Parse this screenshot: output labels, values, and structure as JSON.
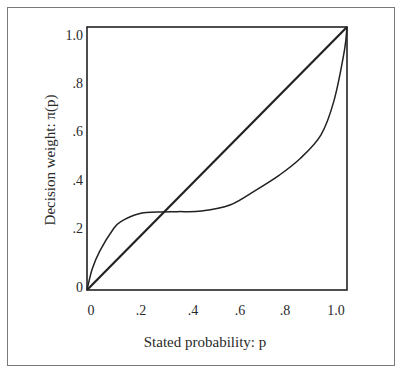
{
  "chart_data": {
    "type": "line",
    "title": "",
    "xlabel": "Stated probability: p",
    "ylabel": "Decision weight: π(p)",
    "xlim": [
      0,
      1
    ],
    "ylim": [
      0,
      1
    ],
    "grid": false,
    "legend": null,
    "x_ticks": [
      "0",
      ".2",
      ".4",
      ".6",
      ".8",
      "1.0"
    ],
    "y_ticks": [
      "0",
      ".2",
      ".4",
      ".6",
      ".8",
      "1.0"
    ],
    "series": [
      {
        "name": "Identity line (π(p) = p)",
        "x": [
          0,
          1
        ],
        "y": [
          0,
          1
        ]
      },
      {
        "name": "Decision weight curve π(p)",
        "x": [
          0,
          0.02,
          0.05,
          0.1,
          0.13,
          0.2,
          0.29,
          0.35,
          0.44,
          0.55,
          0.65,
          0.74,
          0.82,
          0.9,
          0.95,
          0.99,
          1.0
        ],
        "y": [
          0,
          0.08,
          0.15,
          0.23,
          0.26,
          0.29,
          0.297,
          0.298,
          0.3,
          0.323,
          0.38,
          0.437,
          0.5,
          0.59,
          0.72,
          0.91,
          1.0
        ]
      }
    ],
    "annotations": [
      {
        "text": "crossover",
        "x": 0.29,
        "y": 0.29
      }
    ]
  },
  "colors": {
    "line": "#222222",
    "frame": "#7a7a7a",
    "background": "#ffffff"
  }
}
